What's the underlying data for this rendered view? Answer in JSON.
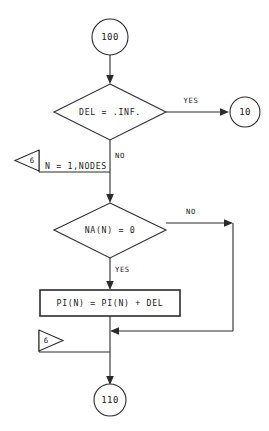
{
  "diagram": {
    "colors": {
      "background": "#ffffff",
      "stroke": "#2b2b2b",
      "text": "#1a1a1a"
    },
    "nodes": {
      "start_connector": {
        "label": "100",
        "kind": "connector-circle"
      },
      "decision_one": {
        "label": "DEL = .INF.",
        "kind": "decision-diamond"
      },
      "exit_connector": {
        "label": "10",
        "kind": "connector-circle"
      },
      "loop_open": {
        "label": "N = 1,NODES",
        "flag_label": "6",
        "kind": "loop-start"
      },
      "decision_two": {
        "label": "NA(N) = 0",
        "kind": "decision-diamond"
      },
      "process_one": {
        "label": "PI(N) = PI(N) + DEL",
        "kind": "process-box"
      },
      "loop_close": {
        "flag_label": "6",
        "kind": "loop-end"
      },
      "end_connector": {
        "label": "110",
        "kind": "connector-circle"
      }
    },
    "branches": {
      "decision_one_yes": "YES",
      "decision_one_no": "NO",
      "decision_two_no": "NO",
      "decision_two_yes": "YES"
    }
  }
}
